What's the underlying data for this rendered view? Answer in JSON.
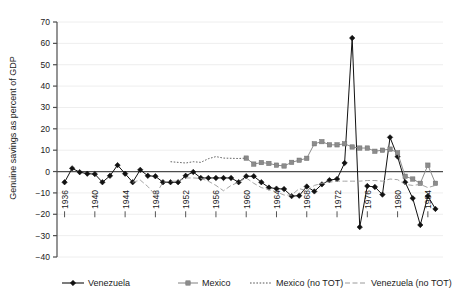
{
  "chart_data": {
    "type": "line",
    "title": "",
    "xlabel": "",
    "ylabel": "Genuine savings as percent of GDP",
    "xlim": [
      1935,
      1986
    ],
    "ylim": [
      -40,
      70
    ],
    "ytick_step": 10,
    "yticks": [
      -40,
      -30,
      -20,
      -10,
      0,
      10,
      20,
      30,
      40,
      50,
      60,
      70
    ],
    "ytick_labels": [
      "-40",
      "-30",
      "-20",
      "-10",
      "0",
      "10",
      "20",
      "30",
      "40",
      "50",
      "60",
      "70"
    ],
    "xticks": [
      1936,
      1940,
      1944,
      1948,
      1952,
      1956,
      1960,
      1964,
      1968,
      1972,
      1976,
      1980,
      1984
    ],
    "xtick_labels": [
      "1936",
      "1940",
      "1944",
      "1948",
      "1952",
      "1956",
      "1960",
      "1964",
      "1968",
      "1972",
      "1976",
      "1980",
      "1984"
    ],
    "xtick_rotation": 90,
    "grid": "faint-horizontal",
    "zero_line": true,
    "legend_position": "below",
    "series": [
      {
        "name": "Venezuela",
        "style": "solid",
        "marker": "diamond",
        "color": "#111111",
        "x": [
          1936,
          1937,
          1938,
          1939,
          1940,
          1941,
          1942,
          1943,
          1944,
          1945,
          1946,
          1947,
          1948,
          1949,
          1950,
          1951,
          1952,
          1953,
          1954,
          1955,
          1956,
          1957,
          1958,
          1959,
          1960,
          1961,
          1962,
          1963,
          1964,
          1965,
          1966,
          1967,
          1968,
          1969,
          1970,
          1971,
          1972,
          1973,
          1974,
          1975,
          1976,
          1977,
          1978,
          1979,
          1980,
          1981,
          1982,
          1983,
          1984,
          1985
        ],
        "values": [
          -5.0,
          1.5,
          -0.3,
          -1.0,
          -1.2,
          -5.0,
          -2.0,
          3.0,
          -1.0,
          -5.0,
          0.8,
          -2.0,
          -2.2,
          -5.0,
          -5.0,
          -5.0,
          -2.0,
          -0.2,
          -3.0,
          -3.0,
          -3.0,
          -3.0,
          -3.0,
          -5.0,
          -2.2,
          -2.2,
          -5.0,
          -7.5,
          -8.0,
          -8.2,
          -11.5,
          -11.3,
          -7.0,
          -9.3,
          -6.0,
          -4.0,
          -3.5,
          4.0,
          62.5,
          -26.0,
          -6.8,
          -7.2,
          -10.8,
          16.0,
          7.0,
          -5.0,
          -12.5,
          -25.0,
          -11.5,
          -17.5
        ]
      },
      {
        "name": "Mexico",
        "style": "solid",
        "marker": "square",
        "color": "#8c8c8c",
        "x": [
          1960,
          1961,
          1962,
          1963,
          1964,
          1965,
          1966,
          1967,
          1968,
          1969,
          1970,
          1971,
          1972,
          1973,
          1974,
          1975,
          1976,
          1977,
          1978,
          1979,
          1980,
          1981,
          1982,
          1983,
          1984,
          1985
        ],
        "values": [
          6.3,
          3.5,
          4.2,
          3.8,
          3.0,
          2.6,
          4.3,
          5.3,
          6.2,
          13.0,
          14.0,
          12.5,
          12.5,
          13.0,
          11.5,
          11.0,
          11.0,
          9.5,
          10.0,
          10.5,
          8.8,
          -2.2,
          -3.5,
          -5.5,
          3.0,
          -5.5
        ]
      },
      {
        "name": "Mexico (no TOT)",
        "style": "dotted",
        "marker": "none",
        "color": "#555555",
        "x": [
          1950,
          1951,
          1952,
          1953,
          1954,
          1955,
          1956,
          1957,
          1958,
          1959,
          1960
        ],
        "values": [
          4.6,
          4.3,
          4.0,
          4.6,
          4.3,
          6.0,
          7.0,
          6.3,
          6.2,
          6.1,
          6.3
        ]
      },
      {
        "name": "Venezuela (no TOT)",
        "style": "dashed",
        "marker": "none",
        "color": "#9a9a9a",
        "x": [
          1945,
          1946,
          1947,
          1948,
          1949,
          1950,
          1951,
          1952,
          1953,
          1954,
          1955,
          1956,
          1957,
          1958,
          1959,
          1960,
          1961,
          1962,
          1963,
          1964,
          1965,
          1966,
          1967,
          1968,
          1969,
          1970,
          1971,
          1972,
          1973,
          1974,
          1975,
          1976,
          1977,
          1978,
          1979,
          1980,
          1981,
          1982,
          1983,
          1984,
          1985
        ],
        "values": [
          -5.0,
          -4.0,
          -7.0,
          -11.0,
          -5.0,
          -4.5,
          -4.5,
          -3.0,
          -3.0,
          -3.2,
          -4.5,
          -6.5,
          -9.0,
          -6.5,
          -5.0,
          -3.0,
          -5.5,
          -7.5,
          -8.5,
          -9.5,
          -11.0,
          -11.0,
          -8.0,
          -9.0,
          -6.5,
          -5.5,
          -5.0,
          -4.5,
          -4.5,
          -4.5,
          -4.5,
          -4.2,
          -4.2,
          -4.5,
          -3.5,
          -3.8,
          -6.0,
          -6.5,
          -6.0,
          -7.5,
          -6.5
        ]
      }
    ]
  },
  "legend": {
    "items": [
      {
        "label": "Venezuela"
      },
      {
        "label": "Mexico"
      },
      {
        "label": "Mexico (no TOT)"
      },
      {
        "label": "Venezuela (no TOT)"
      }
    ]
  }
}
